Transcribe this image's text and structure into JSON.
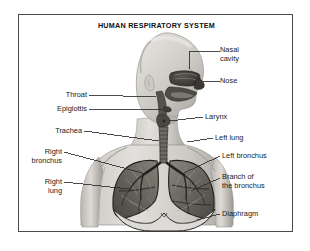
{
  "diagram": {
    "title": "HUMAN RESPIRATORY SYSTEM",
    "style": "grayscale line and tone illustration",
    "view": "head in right-facing profile with sagittal cutaway; chest in frontal cutaway",
    "colors": {
      "background": "#ffffff",
      "frame": "#4a4a4a",
      "text": "#1a1a1a",
      "leader_line": "#2b2b2b",
      "skin_light": "#dcdad6",
      "skin_mid": "#b8b5b0",
      "skin_shadow": "#8e8b86",
      "lung_tissue": "#6e6b66",
      "lung_dark": "#46443f",
      "airway_dark": "#2f2d2a",
      "cavity_dark": "#3a3835"
    },
    "labels": [
      {
        "id": "nasal-cavity",
        "text": "Nasal\ncavity",
        "side": "right",
        "x": 222,
        "y": 47,
        "lines": 2
      },
      {
        "id": "nose",
        "text": "Nose",
        "side": "right",
        "x": 222,
        "y": 77,
        "lines": 1
      },
      {
        "id": "larynx",
        "text": "Larynx",
        "side": "right",
        "x": 205,
        "y": 113,
        "lines": 1
      },
      {
        "id": "left-lung",
        "text": "Left lung",
        "side": "right",
        "x": 215,
        "y": 134,
        "lines": 1
      },
      {
        "id": "left-bronchus",
        "text": "Left bronchus",
        "side": "right",
        "x": 222,
        "y": 152,
        "lines": 1
      },
      {
        "id": "branch-of-bronchus",
        "text": "Branch of\nthe bronchus",
        "side": "right",
        "x": 222,
        "y": 170,
        "lines": 2
      },
      {
        "id": "diaphragm",
        "text": "Diaphragm",
        "side": "right",
        "x": 222,
        "y": 210,
        "lines": 1
      },
      {
        "id": "throat",
        "text": "Throat",
        "side": "left",
        "x": 105,
        "y": 88,
        "lines": 1
      },
      {
        "id": "epiglottis",
        "text": "Epiglottis",
        "side": "left",
        "x": 105,
        "y": 102,
        "lines": 1
      },
      {
        "id": "trachea",
        "text": "Trachea",
        "side": "left",
        "x": 100,
        "y": 124,
        "lines": 1
      },
      {
        "id": "right-bronchus",
        "text": "Right\nbronchus",
        "side": "left",
        "x": 80,
        "y": 150,
        "lines": 2
      },
      {
        "id": "right-lung",
        "text": "Right\nlung",
        "side": "left",
        "x": 80,
        "y": 180,
        "lines": 2
      }
    ],
    "anatomy_parts": [
      "nasal cavity",
      "nose",
      "throat",
      "epiglottis",
      "larynx",
      "trachea",
      "right bronchus",
      "left bronchus",
      "branch of the bronchus",
      "right lung",
      "left lung",
      "diaphragm"
    ]
  }
}
